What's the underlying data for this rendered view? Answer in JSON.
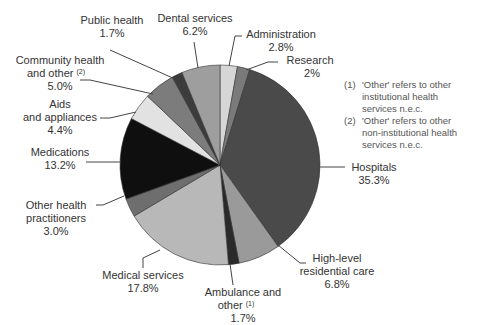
{
  "chart_data": {
    "type": "pie",
    "title": "",
    "start_angle_deg": 0,
    "direction": "clockwise",
    "slices": [
      {
        "label": "Administration",
        "value": 2.8,
        "display": "2.8%",
        "color": "#d6d6d6"
      },
      {
        "label": "Research",
        "value": 2.0,
        "display": "2%",
        "color": "#7a7a7a"
      },
      {
        "label": "Hospitals",
        "value": 35.3,
        "display": "35.3%",
        "color": "#4a4a4a"
      },
      {
        "label": "High-level residential care",
        "value": 6.8,
        "display": "6.8%",
        "color": "#9a9a9a"
      },
      {
        "label": "Ambulance and other (1)",
        "value": 1.7,
        "display": "1.7%",
        "color": "#2a2a2a"
      },
      {
        "label": "Medical services",
        "value": 17.8,
        "display": "17.8%",
        "color": "#b8b8b8"
      },
      {
        "label": "Other health practitioners",
        "value": 3.0,
        "display": "3.0%",
        "color": "#6e6e6e"
      },
      {
        "label": "Medications",
        "value": 13.2,
        "display": "13.2%",
        "color": "#0f0f0f"
      },
      {
        "label": "Aids and appliances",
        "value": 4.4,
        "display": "4.4%",
        "color": "#e2e2e2"
      },
      {
        "label": "Community health and other (2)",
        "value": 5.0,
        "display": "5.0%",
        "color": "#7c7c7c"
      },
      {
        "label": "Public health",
        "value": 1.7,
        "display": "1.7%",
        "color": "#3c3c3c"
      },
      {
        "label": "Dental services",
        "value": 6.2,
        "display": "6.2%",
        "color": "#9e9e9e"
      }
    ],
    "footnotes": [
      "(1) 'Other' refers to other institutional health services n.e.c.",
      "(2) 'Other' refers to other non-institutional health services n.e.c."
    ]
  },
  "labels": {
    "administration": {
      "l1": "Administration",
      "v": "2.8%"
    },
    "research": {
      "l1": "Research",
      "v": "2%"
    },
    "hospitals": {
      "l1": "Hospitals",
      "v": "35.3%"
    },
    "residential": {
      "l1": "High-level",
      "l2": "residential care",
      "v": "6.8%"
    },
    "ambulance": {
      "l1": "Ambulance and",
      "l2": "other",
      "sup": "(1)",
      "v": "1.7%"
    },
    "medical": {
      "l1": "Medical services",
      "v": "17.8%"
    },
    "practitioners": {
      "l1": "Other health",
      "l2": "practitioners",
      "v": "3.0%"
    },
    "medications": {
      "l1": "Medications",
      "v": "13.2%"
    },
    "aids": {
      "l1": "Aids",
      "l2": "and appliances",
      "v": "4.4%"
    },
    "community": {
      "l1": "Community health",
      "l2": "and other",
      "sup": "(2)",
      "v": "5.0%"
    },
    "public": {
      "l1": "Public health",
      "v": "1.7%"
    },
    "dental": {
      "l1": "Dental services",
      "v": "6.2%"
    }
  },
  "footnotes": {
    "n1_mark": "(1)",
    "n1_l1": "'Other' refers to other",
    "n1_l2": "institutional health",
    "n1_l3": "services n.e.c.",
    "n2_mark": "(2)",
    "n2_l1": "'Other' refers to other",
    "n2_l2": "non-institutional health",
    "n2_l3": "services n.e.c."
  }
}
